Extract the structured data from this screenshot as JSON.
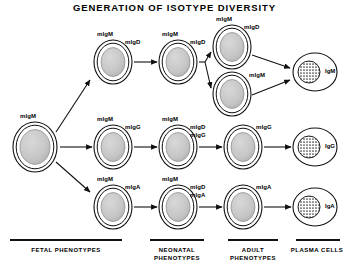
{
  "title": "GENERATION OF ISOTYPE DIVERSITY",
  "columns": [
    {
      "id": "fetal",
      "caption": "FETAL  PHENOTYPES",
      "rule": {
        "x1": 10,
        "x2": 122,
        "y": 240
      },
      "caption_box": {
        "x": 8,
        "y": 246,
        "w": 116
      }
    },
    {
      "id": "neonatal",
      "caption": "NEONATAL\nPHENOTYPES",
      "rule": {
        "x1": 150,
        "x2": 204,
        "y": 240
      },
      "caption_box": {
        "x": 148,
        "y": 246,
        "w": 58
      }
    },
    {
      "id": "adult",
      "caption": "ADULT\nPHENOTYPES",
      "rule": {
        "x1": 228,
        "x2": 278,
        "y": 240
      },
      "caption_box": {
        "x": 226,
        "y": 246,
        "w": 54
      }
    },
    {
      "id": "plasma",
      "caption": "PLASMA CELLS",
      "rule": {
        "x1": 296,
        "x2": 340,
        "y": 240
      },
      "caption_box": {
        "x": 288,
        "y": 246,
        "w": 58
      }
    }
  ],
  "cells": [
    {
      "id": "fetal-stem",
      "name": "fetal-cell-migm",
      "kind": "membrane",
      "cx": 35,
      "cy": 147,
      "rx": 22,
      "ry": 25,
      "receptors": [
        {
          "text": "mIgM",
          "x": 20,
          "y": 113
        }
      ]
    },
    {
      "id": "neo-top",
      "name": "neonatal-cell-migm-migd",
      "kind": "membrane",
      "cx": 113,
      "cy": 62,
      "rx": 19,
      "ry": 22,
      "receptors": [
        {
          "text": "mIgM",
          "x": 97,
          "y": 31
        },
        {
          "text": "mIgD",
          "x": 125,
          "y": 39
        }
      ]
    },
    {
      "id": "neo-mid",
      "name": "neonatal-cell-migm-migg",
      "kind": "membrane",
      "cx": 113,
      "cy": 147,
      "rx": 19,
      "ry": 22,
      "receptors": [
        {
          "text": "mIgM",
          "x": 97,
          "y": 116
        },
        {
          "text": "mIgG",
          "x": 125,
          "y": 124
        }
      ]
    },
    {
      "id": "neo-bot",
      "name": "neonatal-cell-migm-miga",
      "kind": "membrane",
      "cx": 113,
      "cy": 207,
      "rx": 19,
      "ry": 22,
      "receptors": [
        {
          "text": "mIgM",
          "x": 97,
          "y": 176
        },
        {
          "text": "mIgA",
          "x": 125,
          "y": 184
        }
      ]
    },
    {
      "id": "adult-top",
      "name": "adult-cell-migm-migd",
      "kind": "membrane",
      "cx": 178,
      "cy": 62,
      "rx": 19,
      "ry": 22,
      "receptors": [
        {
          "text": "mIgM",
          "x": 162,
          "y": 31
        },
        {
          "text": "mIgD",
          "x": 190,
          "y": 39
        }
      ]
    },
    {
      "id": "adult-mid",
      "name": "adult-cell-migm-migd-migg",
      "kind": "membrane",
      "cx": 178,
      "cy": 147,
      "rx": 19,
      "ry": 22,
      "receptors": [
        {
          "text": "mIgM",
          "x": 162,
          "y": 116
        },
        {
          "text": "mIgD",
          "x": 190,
          "y": 124
        },
        {
          "text": "mIgG",
          "x": 190,
          "y": 132
        }
      ]
    },
    {
      "id": "adult-bot",
      "name": "adult-cell-migm-migd-miga",
      "kind": "membrane",
      "cx": 178,
      "cy": 207,
      "rx": 19,
      "ry": 22,
      "receptors": [
        {
          "text": "mIgM",
          "x": 162,
          "y": 176
        },
        {
          "text": "mIgD",
          "x": 190,
          "y": 184
        },
        {
          "text": "mIgA",
          "x": 190,
          "y": 192
        }
      ]
    },
    {
      "id": "branch-top",
      "name": "adult-branch-cell-migm-migd",
      "kind": "membrane",
      "cx": 232,
      "cy": 47,
      "rx": 19,
      "ry": 22,
      "receptors": [
        {
          "text": "mIgM",
          "x": 216,
          "y": 16
        },
        {
          "text": "mIgD",
          "x": 244,
          "y": 24
        }
      ]
    },
    {
      "id": "branch-bot",
      "name": "adult-branch-cell-migm",
      "kind": "membrane",
      "cx": 232,
      "cy": 94,
      "rx": 19,
      "ry": 22,
      "receptors": [
        {
          "text": "mIgM",
          "x": 249,
          "y": 72
        }
      ]
    },
    {
      "id": "adult-g",
      "name": "adult-cell-migg",
      "kind": "membrane",
      "cx": 243,
      "cy": 147,
      "rx": 19,
      "ry": 22,
      "receptors": [
        {
          "text": "mIgG",
          "x": 256,
          "y": 124
        }
      ]
    },
    {
      "id": "adult-a",
      "name": "adult-cell-miga",
      "kind": "membrane",
      "cx": 243,
      "cy": 207,
      "rx": 19,
      "ry": 22,
      "receptors": [
        {
          "text": "mIgA",
          "x": 256,
          "y": 184
        }
      ]
    },
    {
      "id": "plasma-m",
      "name": "plasma-cell-igm",
      "kind": "plasma",
      "cx": 315,
      "cy": 72,
      "rx": 22,
      "ry": 19,
      "nucleus": {
        "dx": -6,
        "r": 11
      },
      "isotype": {
        "text": "IgM",
        "x": 325,
        "y": 68
      }
    },
    {
      "id": "plasma-g",
      "name": "plasma-cell-igg",
      "kind": "plasma",
      "cx": 315,
      "cy": 147,
      "rx": 22,
      "ry": 19,
      "nucleus": {
        "dx": -6,
        "r": 11
      },
      "isotype": {
        "text": "IgG",
        "x": 325,
        "y": 143
      }
    },
    {
      "id": "plasma-a",
      "name": "plasma-cell-iga",
      "kind": "plasma",
      "cx": 315,
      "cy": 207,
      "rx": 22,
      "ry": 19,
      "nucleus": {
        "dx": -6,
        "r": 11
      },
      "isotype": {
        "text": "IgA",
        "x": 325,
        "y": 203
      }
    }
  ],
  "arrows": [
    {
      "name": "arrow-fetal-to-neonatal-top",
      "x1": 56,
      "y1": 132,
      "x2": 90,
      "y2": 80
    },
    {
      "name": "arrow-fetal-to-neonatal-mid",
      "x1": 60,
      "y1": 147,
      "x2": 92,
      "y2": 147
    },
    {
      "name": "arrow-fetal-to-neonatal-bot",
      "x1": 56,
      "y1": 162,
      "x2": 90,
      "y2": 192
    },
    {
      "name": "arrow-neonatal-to-adult-top",
      "x1": 134,
      "y1": 62,
      "x2": 157,
      "y2": 62
    },
    {
      "name": "arrow-neonatal-to-adult-mid",
      "x1": 134,
      "y1": 147,
      "x2": 157,
      "y2": 147
    },
    {
      "name": "arrow-neonatal-to-adult-bot",
      "x1": 134,
      "y1": 207,
      "x2": 157,
      "y2": 207
    },
    {
      "name": "arrow-adult-branch-upper",
      "x1": 205,
      "y1": 62,
      "x2": 211,
      "y2": 52
    },
    {
      "name": "arrow-adult-branch-lower",
      "x1": 205,
      "y1": 62,
      "x2": 211,
      "y2": 88
    },
    {
      "name": "arrow-branch-top-to-plasma",
      "x1": 252,
      "y1": 55,
      "x2": 290,
      "y2": 68
    },
    {
      "name": "arrow-branch-bot-to-plasma",
      "x1": 252,
      "y1": 95,
      "x2": 290,
      "y2": 80
    },
    {
      "name": "arrow-adult-mid-to-g",
      "x1": 199,
      "y1": 147,
      "x2": 222,
      "y2": 147
    },
    {
      "name": "arrow-adult-bot-to-a",
      "x1": 199,
      "y1": 207,
      "x2": 222,
      "y2": 207
    },
    {
      "name": "arrow-g-to-plasma",
      "x1": 264,
      "y1": 147,
      "x2": 291,
      "y2": 147
    },
    {
      "name": "arrow-a-to-plasma",
      "x1": 264,
      "y1": 207,
      "x2": 291,
      "y2": 207
    }
  ],
  "branch_stem": {
    "name": "branch-stem",
    "x1": 199,
    "y1": 62,
    "x2": 205,
    "y2": 62
  },
  "colors": {
    "ink": "#111111",
    "nucleus_fill": "#c8c8c8",
    "membrane_fill": "#ffffff",
    "plasma_nucleus": "#909090",
    "background": "#ffffff"
  }
}
